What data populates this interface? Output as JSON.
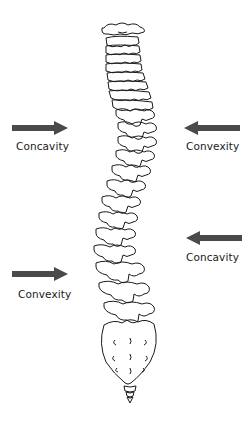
{
  "diagram": {
    "arrow_color": "#4a4a4a",
    "line_color": "#1a1a1a",
    "annotations": [
      {
        "id": "upper-left",
        "label": "Concavity",
        "arrow_direction": "right",
        "side": "left"
      },
      {
        "id": "upper-right",
        "label": "Convexity",
        "arrow_direction": "left",
        "side": "right"
      },
      {
        "id": "lower-right",
        "label": "Concavity",
        "arrow_direction": "left",
        "side": "right"
      },
      {
        "id": "lower-left",
        "label": "Convexity",
        "arrow_direction": "right",
        "side": "left"
      }
    ]
  }
}
